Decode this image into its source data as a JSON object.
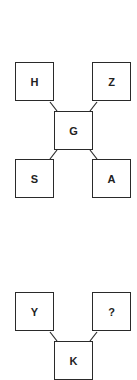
{
  "puzzle_1": {
    "top_left": "H",
    "top_right": "Z",
    "center": "G",
    "bottom_left": "S",
    "bottom_right": "A"
  },
  "puzzle_2": {
    "top_left": "Y",
    "top_right": "?",
    "center": "K"
  },
  "colors": {
    "stroke": "#2a2a2a",
    "text": "#222222",
    "background": "#ffffff"
  }
}
